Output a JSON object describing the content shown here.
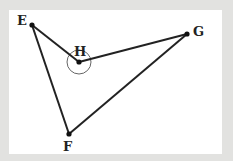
{
  "figure": {
    "type": "quadrilateral",
    "background_color": "#e2e2e0",
    "panel_color": "#ffffff",
    "stroke_color": "#222222",
    "vertices": [
      {
        "name": "E",
        "x": 32,
        "y": 25,
        "label_x": 17,
        "label_y": 14
      },
      {
        "name": "H",
        "x": 79,
        "y": 62,
        "label_x": 74,
        "label_y": 45
      },
      {
        "name": "G",
        "x": 187,
        "y": 34,
        "label_x": 193,
        "label_y": 25
      },
      {
        "name": "F",
        "x": 69,
        "y": 134,
        "label_x": 63,
        "label_y": 140
      }
    ],
    "edges": [
      [
        "E",
        "H"
      ],
      [
        "H",
        "G"
      ],
      [
        "G",
        "F"
      ],
      [
        "F",
        "E"
      ]
    ],
    "angle_marker": {
      "vertex": "H",
      "type": "reflex-arc",
      "radius": 12
    }
  },
  "labels": {
    "E": "E",
    "H": "H",
    "G": "G",
    "F": "F"
  }
}
